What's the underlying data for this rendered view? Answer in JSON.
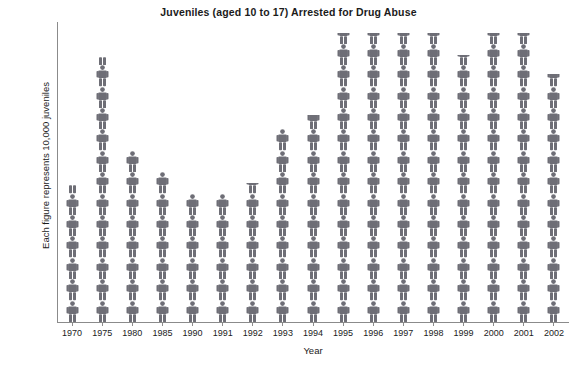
{
  "chart": {
    "title": "Juveniles (aged 10 to 17) Arrested for Drug Abuse",
    "xlabel": "Year",
    "ylabel": "Each figure represents 10,000 juveniles",
    "figure_icon": "person-icon",
    "figure_color": "#6e6e76",
    "axis_color": "#8b8b8b",
    "text_color": "#1b1b1b",
    "background": "#ffffff"
  },
  "chart_data": {
    "type": "bar",
    "title": "Juveniles (aged 10 to 17) Arrested for Drug Abuse",
    "xlabel": "Year",
    "ylabel": "Each figure represents 10,000 juveniles",
    "unit_per_figure": 10000,
    "categories": [
      "1970",
      "1975",
      "1980",
      "1985",
      "1990",
      "1991",
      "1992",
      "1993",
      "1994",
      "1995",
      "1996",
      "1997",
      "1998",
      "1999",
      "2000",
      "2001",
      "2002"
    ],
    "values": [
      6.4,
      12.4,
      8.0,
      7.0,
      6.0,
      6.0,
      6.5,
      9.0,
      9.7,
      13.5,
      13.5,
      13.5,
      13.5,
      12.5,
      13.5,
      13.5,
      11.6
    ],
    "values_in_juveniles": [
      64000,
      124000,
      80000,
      70000,
      60000,
      60000,
      65000,
      90000,
      97000,
      135000,
      135000,
      135000,
      135000,
      125000,
      135000,
      135000,
      116000
    ],
    "ylim": [
      0,
      14
    ],
    "grid": false,
    "legend": false
  }
}
